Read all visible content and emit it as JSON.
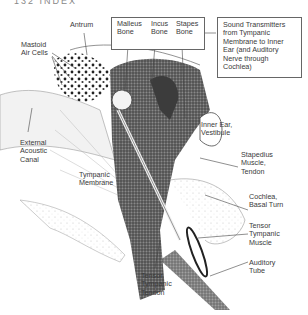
{
  "header": {
    "partial_text": "132  INDEX"
  },
  "diagram": {
    "labels": {
      "antrum": "Antrum",
      "mastoid": "Mastoid\nAir Cells",
      "external_canal": "External\nAcoustic\nCanal",
      "tympanic_membrane": "Tympanic\nMembrane",
      "malleus": "Malleus\nBone",
      "incus": "Incus\nBone",
      "stapes": "Stapes\nBone",
      "sound_note": "Sound Transmitters\nfrom Tympanic\nMembrane to Inner\nEar (and Auditory\nNerve through\nCochlea)",
      "vestibule": "Inner Ear,\nVestibule",
      "stapedius": "Stapedius\nMuscle,\nTendon",
      "cochlea": "Cochlea,\nBasal Turn",
      "tensor_muscle": "Tensor\nTympanic\nMuscle",
      "auditory_tube": "Auditory\nTube",
      "tensor_tendon": "Tensor\nTympanic\nTendon"
    },
    "colors": {
      "ink": "#333333",
      "shade_dark": "#4a4a4a",
      "shade_mid": "#8a8a8a",
      "paper": "#ffffff"
    }
  }
}
